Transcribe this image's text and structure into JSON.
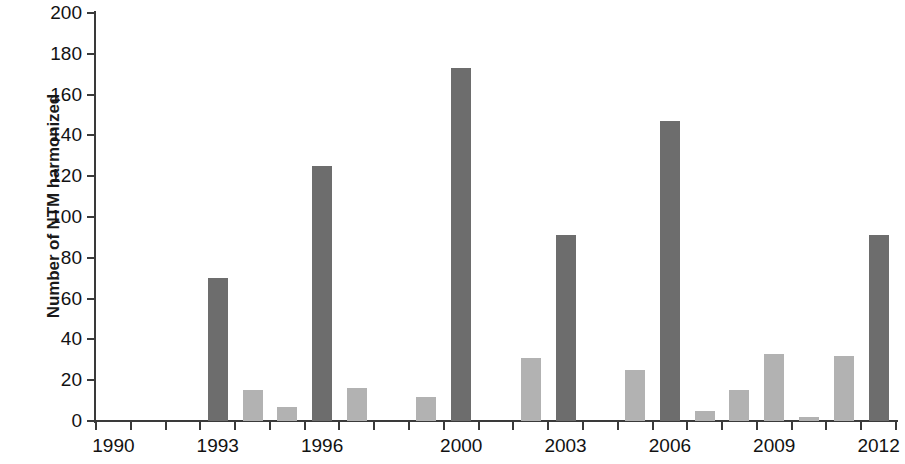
{
  "chart_data": {
    "type": "bar",
    "title": "",
    "subtitle": "",
    "xlabel": "",
    "ylabel": "Number of NTM harmonized",
    "ylim": [
      0,
      200
    ],
    "ytick_step": 20,
    "yticks": [
      0,
      20,
      40,
      60,
      80,
      100,
      120,
      140,
      160,
      180,
      200
    ],
    "ytick_labels": [
      "0",
      "20",
      "40",
      "60",
      "80",
      "100",
      "120",
      "140",
      "160",
      "180",
      "200"
    ],
    "xlim": [
      1989.5,
      2012.5
    ],
    "categories": [
      "1990",
      "1991",
      "1992",
      "1993",
      "1994",
      "1995",
      "1996",
      "1997",
      "1998",
      "1999",
      "2000",
      "2001",
      "2002",
      "2003",
      "2004",
      "2005",
      "2006",
      "2007",
      "2008",
      "2009",
      "2010",
      "2011",
      "2012"
    ],
    "xtick_labels": [
      "1990",
      "1993",
      "1996",
      "2000",
      "2003",
      "2006",
      "2009",
      "2012"
    ],
    "values": [
      0,
      0,
      0,
      70,
      15,
      7,
      125,
      16,
      0,
      12,
      173,
      0,
      31,
      91,
      0,
      25,
      147,
      5,
      15,
      33,
      2,
      32,
      91
    ],
    "bar_colors": [
      "light",
      "light",
      "light",
      "dark",
      "light",
      "light",
      "dark",
      "light",
      "light",
      "light",
      "dark",
      "light",
      "light",
      "dark",
      "light",
      "light",
      "dark",
      "light",
      "light",
      "light",
      "light",
      "light",
      "dark"
    ],
    "grid": false,
    "legend": "none",
    "colors": {
      "dark_bar": "#6d6d6d",
      "light_bar": "#b2b2b2",
      "axis": "#3a3a3a",
      "text": "#121212",
      "background": "#ffffff"
    }
  }
}
